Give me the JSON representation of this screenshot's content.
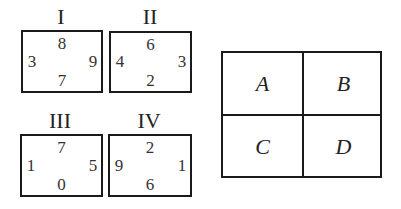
{
  "panels": [
    {
      "label": "I",
      "top": "8",
      "left": "3",
      "right": "9",
      "bottom": "7"
    },
    {
      "label": "II",
      "top": "6",
      "left": "4",
      "right": "3",
      "bottom": "2"
    },
    {
      "label": "III",
      "top": "7",
      "left": "1",
      "right": "5",
      "bottom": "0"
    },
    {
      "label": "IV",
      "top": "2",
      "left": "9",
      "right": "1",
      "bottom": "6"
    }
  ],
  "grid": {
    "cells": [
      "A",
      "B",
      "C",
      "D"
    ]
  }
}
